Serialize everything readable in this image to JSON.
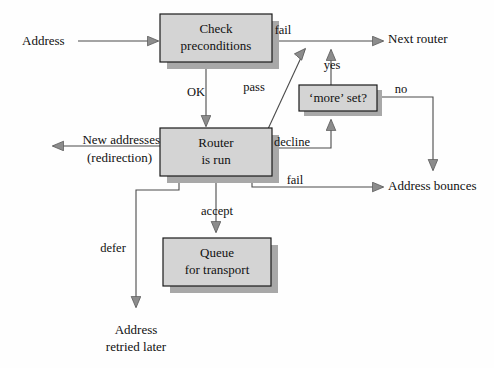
{
  "diagram": {
    "colors": {
      "background": "#fefefe",
      "node_fill": "#d4d4d4",
      "node_stroke": "#1a1a1a",
      "node_shadow": "#a8a8a8",
      "edge_stroke": "#4a4a4a",
      "arrow_fill": "#8c8c8c",
      "arrow_stroke": "#5a5a5a",
      "text": "#101010"
    },
    "nodes": [
      {
        "id": "check",
        "line1": "Check",
        "line2": "preconditions",
        "x": 160,
        "y": 14,
        "w": 112,
        "h": 48
      },
      {
        "id": "router",
        "line1": "Router",
        "line2": "is run",
        "x": 160,
        "y": 128,
        "w": 112,
        "h": 48
      },
      {
        "id": "more",
        "line1": "‘more’ set?",
        "line2": "",
        "x": 299,
        "y": 85,
        "w": 78,
        "h": 26
      },
      {
        "id": "queue",
        "line1": "Queue",
        "line2": "for transport",
        "x": 163,
        "y": 238,
        "w": 108,
        "h": 48
      }
    ],
    "edge_labels": [
      {
        "id": "ok",
        "text": "OK",
        "x": 196,
        "y": 93
      },
      {
        "id": "fail-top",
        "text": "fail",
        "x": 283,
        "y": 31
      },
      {
        "id": "pass",
        "text": "pass",
        "x": 254,
        "y": 88
      },
      {
        "id": "yes",
        "text": "yes",
        "x": 330,
        "y": 65
      },
      {
        "id": "no",
        "text": "no",
        "x": 400,
        "y": 90
      },
      {
        "id": "decline",
        "text": "decline",
        "x": 285,
        "y": 145
      },
      {
        "id": "fail-bot",
        "text": "fail",
        "x": 295,
        "y": 182
      },
      {
        "id": "accept",
        "text": "accept",
        "x": 216,
        "y": 213
      },
      {
        "id": "defer",
        "text": "defer",
        "x": 114,
        "y": 249
      }
    ],
    "terminals": [
      {
        "id": "address-in",
        "line1": "Address",
        "line2": "",
        "x": 24,
        "y": 42,
        "align": "start"
      },
      {
        "id": "next-router",
        "line1": "Next router",
        "line2": "",
        "x": 388,
        "y": 40,
        "align": "start"
      },
      {
        "id": "new-addresses",
        "line1": "New addresses",
        "line2": "(redirection)",
        "x": 152,
        "y": 146,
        "align": "end"
      },
      {
        "id": "address-bounce",
        "line1": "Address bounces",
        "line2": "",
        "x": 388,
        "y": 187,
        "align": "start"
      },
      {
        "id": "address-retry",
        "line1": "Address",
        "line2": "retried later",
        "x": 136,
        "y": 331,
        "align": "mid"
      }
    ],
    "edges": [
      {
        "id": "edge-address-to-check",
        "from": "Address",
        "to": "Check preconditions",
        "label": ""
      },
      {
        "id": "edge-check-ok-router",
        "from": "Check preconditions",
        "to": "Router is run",
        "label": "OK"
      },
      {
        "id": "edge-check-fail-next",
        "from": "Check preconditions",
        "to": "Next router",
        "label": "fail"
      },
      {
        "id": "edge-router-pass-next",
        "from": "Router is run",
        "to": "Next router",
        "label": "pass"
      },
      {
        "id": "edge-router-redirect",
        "from": "Router is run",
        "to": "New addresses (redirection)",
        "label": ""
      },
      {
        "id": "edge-router-decline-more",
        "from": "Router is run",
        "to": "‘more’ set?",
        "label": "decline"
      },
      {
        "id": "edge-more-yes-next",
        "from": "‘more’ set?",
        "to": "Next router",
        "label": "yes"
      },
      {
        "id": "edge-more-no-bounce",
        "from": "‘more’ set?",
        "to": "Address bounces",
        "label": "no"
      },
      {
        "id": "edge-router-fail-bounce",
        "from": "Router is run",
        "to": "Address bounces",
        "label": "fail"
      },
      {
        "id": "edge-router-accept-queue",
        "from": "Router is run",
        "to": "Queue for transport",
        "label": "accept"
      },
      {
        "id": "edge-router-defer-retry",
        "from": "Router is run",
        "to": "Address retried later",
        "label": "defer"
      }
    ]
  }
}
